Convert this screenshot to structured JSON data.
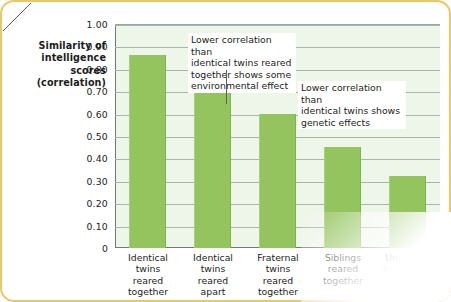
{
  "chart_data": {
    "type": "bar",
    "title": "",
    "xlabel": "",
    "ylabel": "Similarity of intelligence scores (correlation)",
    "ylim": [
      0,
      1.0
    ],
    "grid": true,
    "legend": "none",
    "categories": [
      "Identical twins reared together",
      "Identical twins reared apart",
      "Fraternal twins reared together",
      "Siblings reared together",
      "Unrelated individuals reared together"
    ],
    "values": [
      0.86,
      0.72,
      0.6,
      0.45,
      0.32
    ],
    "ytick_labels": [
      "1.00",
      "0.90",
      "0.80",
      "0.70",
      "0.60",
      "0.50",
      "0.40",
      "0.30",
      "0.20",
      "0.10",
      "0"
    ],
    "ytick_values": [
      1.0,
      0.9,
      0.8,
      0.7,
      0.6,
      0.5,
      0.4,
      0.3,
      0.2,
      0.1,
      0
    ],
    "annotations": [
      {
        "id": "annotation-environmental-effect",
        "text": "Lower correlation than identical twins reared together shows some environmental effect",
        "target_category": "Identical twins reared apart"
      },
      {
        "id": "annotation-genetic-effects",
        "text": "Lower correlation than identical twins shows genetic effects",
        "target_category": "Fraternal twins reared together"
      }
    ],
    "colors": {
      "bar": "#93c45e",
      "plot_background": "#eef5e9",
      "gridline": "#aab4ad",
      "card_border": "#e8c96a",
      "text": "#1d1d1b"
    }
  },
  "axis_title": {
    "line1": "Similarity of",
    "line2": "intelligence",
    "line3": "scores",
    "line4": "(correlation)"
  },
  "categories_lines": [
    [
      "Identical",
      "twins",
      "reared",
      "together"
    ],
    [
      "Identical",
      "twins",
      "reared",
      "apart"
    ],
    [
      "Fraternal",
      "twins",
      "reared",
      "together"
    ],
    [
      "Siblings",
      "reared",
      "together"
    ],
    [
      "Unrelated",
      "individuals",
      "reared",
      "together"
    ]
  ],
  "annotation_lines": [
    [
      "Lower correlation than",
      "identical twins reared",
      "together shows some",
      "environmental effect"
    ],
    [
      "Lower correlation than",
      "identical twins shows",
      "genetic effects"
    ]
  ]
}
